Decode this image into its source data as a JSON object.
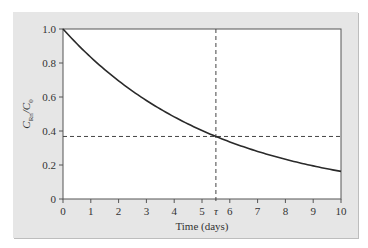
{
  "chart_data": {
    "type": "line",
    "title": "",
    "xlabel": "Time (days)",
    "ylabel": "C_Rn/C_0",
    "ylabel_main": "C",
    "ylabel_sub1": "Rn",
    "ylabel_slash": "/C",
    "ylabel_sub2": "0",
    "xlim": [
      0,
      10
    ],
    "ylim": [
      0,
      1.0
    ],
    "x_ticks": [
      "0",
      "1",
      "2",
      "3",
      "4",
      "5",
      "6",
      "7",
      "8",
      "9",
      "10"
    ],
    "y_ticks": [
      "0",
      "0.2",
      "0.4",
      "0.6",
      "0.8",
      "1.0"
    ],
    "grid": false,
    "legend": null,
    "series": [
      {
        "name": "C_Rn/C_0 = exp(-t/τ)",
        "x": [
          0,
          1,
          2,
          3,
          4,
          5,
          5.5,
          6,
          7,
          8,
          9,
          10
        ],
        "values": [
          1.0,
          0.834,
          0.695,
          0.58,
          0.483,
          0.403,
          0.368,
          0.336,
          0.28,
          0.234,
          0.195,
          0.162
        ]
      }
    ],
    "annotations": [
      {
        "type": "vline",
        "x": 5.5,
        "style": "dashed",
        "label": "τ"
      },
      {
        "type": "hline",
        "y": 0.368,
        "style": "dashed"
      }
    ],
    "tau_days": 5.5,
    "tau_label": "τ"
  }
}
